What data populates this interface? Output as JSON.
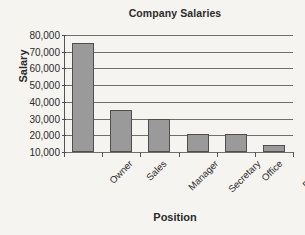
{
  "chart_data": {
    "type": "bar",
    "title": "Company Salaries",
    "xlabel": "Position",
    "ylabel": "Salary",
    "categories": [
      "Owner",
      "Sales",
      "Manager",
      "Secretary",
      "Office",
      "Delivery"
    ],
    "values": [
      75000,
      35000,
      30000,
      21000,
      21000,
      14000
    ],
    "ylim": [
      10000,
      80000
    ],
    "ytick_values": [
      10000,
      20000,
      30000,
      40000,
      50000,
      60000,
      70000,
      80000
    ],
    "ytick_labels": [
      "10,000",
      "20,000",
      "30,000",
      "40,000",
      "50,000",
      "60,000",
      "70,000",
      "80,000"
    ],
    "grid": true,
    "legend": false,
    "bar_color": "#9a9a9a",
    "bar_border_color": "#4f4f4f",
    "background_color": "#f6f4f1",
    "text_color": "#2b2b2b"
  }
}
